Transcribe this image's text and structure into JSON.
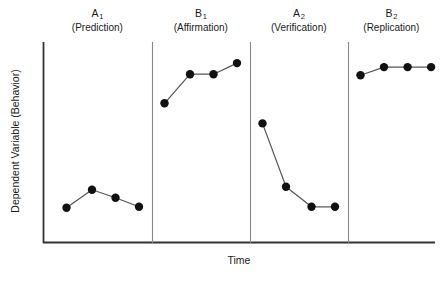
{
  "chart_data": {
    "type": "line",
    "title": "",
    "xlabel": "Time",
    "ylabel": "Dependent Variable (Behavior)",
    "grid": false,
    "legend": "none",
    "axis_style": "open-L (left spine and bottom spine only, no ticks, no tick labels)",
    "xlim": [
      0,
      20
    ],
    "ylim": [
      0,
      10
    ],
    "marker": "filled-circle-black",
    "phase_design": "ABAB reversal / withdrawal single-case design",
    "phases": [
      {
        "id": "A1",
        "name": "A",
        "subscript": "1",
        "description": "(Prediction)",
        "condition": "baseline",
        "points": [
          {
            "x": 1.2,
            "y": 1.75
          },
          {
            "x": 2.5,
            "y": 2.65
          },
          {
            "x": 3.7,
            "y": 2.25
          },
          {
            "x": 4.9,
            "y": 1.8
          }
        ]
      },
      {
        "id": "B1",
        "name": "B",
        "subscript": "1",
        "description": "(Affirmation)",
        "condition": "treatment",
        "points": [
          {
            "x": 6.2,
            "y": 6.95
          },
          {
            "x": 7.5,
            "y": 8.4
          },
          {
            "x": 8.7,
            "y": 8.4
          },
          {
            "x": 9.9,
            "y": 8.95
          }
        ]
      },
      {
        "id": "A2",
        "name": "A",
        "subscript": "2",
        "description": "(Verification)",
        "condition": "baseline",
        "points": [
          {
            "x": 11.2,
            "y": 5.95
          },
          {
            "x": 12.4,
            "y": 2.8
          },
          {
            "x": 13.7,
            "y": 1.8
          },
          {
            "x": 14.9,
            "y": 1.8
          }
        ]
      },
      {
        "id": "B2",
        "name": "B",
        "subscript": "2",
        "description": "(Replication)",
        "condition": "treatment",
        "points": [
          {
            "x": 16.2,
            "y": 8.35
          },
          {
            "x": 17.4,
            "y": 8.75
          },
          {
            "x": 18.6,
            "y": 8.75
          },
          {
            "x": 19.8,
            "y": 8.75
          }
        ]
      }
    ],
    "phase_dividers": [
      5.55,
      10.55,
      15.55
    ],
    "colors": {
      "line": "#555555",
      "marker": "#111111",
      "axis": "#333333",
      "divider": "#888888",
      "text": "#1a1a1a",
      "background": "#ffffff"
    }
  }
}
